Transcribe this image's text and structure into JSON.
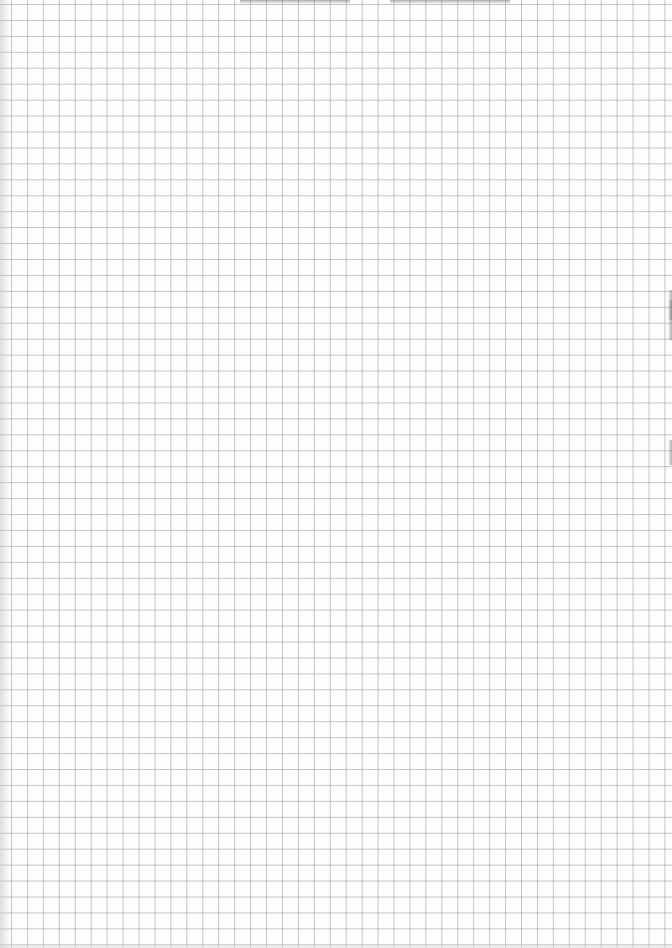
{
  "document": {
    "type": "grid-paper-scan",
    "grid": {
      "cell_size_px": 16,
      "line_color": "#969696",
      "background_color": "#fdfdfd"
    },
    "content": {
      "text": ""
    }
  }
}
